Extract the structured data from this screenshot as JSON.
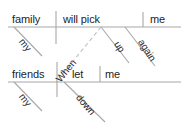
{
  "diagram": {
    "type": "reed-kellogg-sentence-diagram",
    "sentence": "When my family will pick me up again my friends let me down",
    "stroke_color": "#9a9a9a",
    "text_color": "#1d1d1d",
    "background_color": "#ffffff",
    "clauses": [
      {
        "id": "main-clause",
        "baseline_y": 27,
        "parts": [
          {
            "role": "subject",
            "text": "family"
          },
          {
            "role": "verb",
            "text": "will pick"
          },
          {
            "role": "direct-object",
            "text": "me"
          }
        ],
        "modifiers": [
          {
            "role": "possessive-modifier",
            "text": "my",
            "attaches_to": "family"
          },
          {
            "role": "adverb",
            "text": "up",
            "attaches_to": "will pick"
          },
          {
            "role": "adverb",
            "text": "again",
            "attaches_to": "will pick"
          }
        ]
      },
      {
        "id": "subordinate-clause",
        "baseline_y": 82,
        "parts": [
          {
            "role": "subject",
            "text": "friends"
          },
          {
            "role": "verb",
            "text": "let"
          },
          {
            "role": "direct-object",
            "text": "me"
          }
        ],
        "modifiers": [
          {
            "role": "possessive-modifier",
            "text": "my",
            "attaches_to": "friends"
          },
          {
            "role": "adverb",
            "text": "down",
            "attaches_to": "let"
          }
        ]
      }
    ],
    "connector": {
      "role": "subordinating-conjunction",
      "text": "When",
      "style": "dashed-diagonal",
      "links": [
        "main-clause",
        "subordinate-clause"
      ]
    }
  }
}
